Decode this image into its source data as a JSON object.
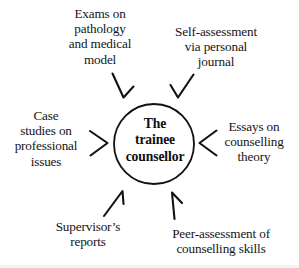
{
  "diagram": {
    "centre": {
      "name": "centre-node",
      "text": "The\ntrainee\ncounsellor",
      "shape": "circle",
      "cx": 154,
      "cy": 144,
      "r": 40,
      "stroke_color": "#111111",
      "fill_color": "#ffffff",
      "stroke_width": 1.7
    },
    "nodes": [
      {
        "id": "exams-on-pathology-and-medical-model",
        "text": "Exams on\npathology\nand medical\nmodel",
        "position": "top-left",
        "arrow": {
          "name": "arrow-top-left",
          "direction": "down-right",
          "points_to": "centre-node"
        }
      },
      {
        "id": "self-assessment-via-personal-journal",
        "text": "Self-assessment\nvia personal\njournal",
        "position": "top-right",
        "arrow": {
          "name": "arrow-top-right",
          "direction": "down-left",
          "points_to": "centre-node"
        }
      },
      {
        "id": "case-studies-on-professional-issues",
        "text": "Case\nstudies on\nprofessional\nissues",
        "position": "left",
        "arrow": {
          "name": "arrow-left",
          "direction": "right",
          "points_to": "centre-node"
        }
      },
      {
        "id": "essays-on-counselling-theory",
        "text": "Essays on\ncounselling\ntheory",
        "position": "right",
        "arrow": {
          "name": "arrow-right",
          "direction": "left",
          "points_to": "centre-node"
        }
      },
      {
        "id": "supervisors-reports",
        "text": "Supervisor’s\nreports",
        "position": "bottom-left",
        "arrow": {
          "name": "arrow-bottom-left",
          "direction": "up-right",
          "points_to": "centre-node"
        }
      },
      {
        "id": "peer-assessment-of-counselling-skills",
        "text": "Peer-assessment of\ncounselling skills",
        "position": "bottom-right",
        "arrow": {
          "name": "arrow-bottom-right",
          "direction": "up",
          "points_to": "centre-node"
        }
      }
    ],
    "colors": {
      "background": "#ffffff",
      "ink": "#141414",
      "centre_ink": "#0d0d0d",
      "stroke": "#111111",
      "bottom_tint": "#f2f2f2"
    }
  }
}
